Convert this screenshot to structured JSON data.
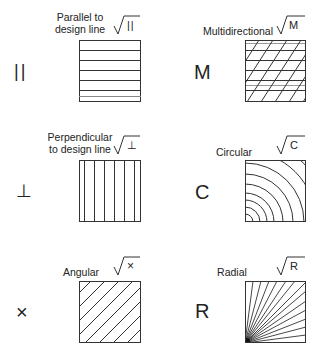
{
  "symbols": [
    {
      "id": "parallel",
      "label_line1": "Parallel to",
      "label_line2": "design line",
      "symbol": "||",
      "root_text": "||",
      "pattern": "horizontal-lines"
    },
    {
      "id": "multidirectional",
      "label_line1": "Multidirectional",
      "label_line2": "",
      "symbol": "M",
      "root_text": "M",
      "pattern": "cross-hatch"
    },
    {
      "id": "perpendicular",
      "label_line1": "Perpendicular",
      "label_line2": "to design line",
      "symbol": "⊥",
      "root_text": "⊥",
      "pattern": "vertical-lines"
    },
    {
      "id": "circular",
      "label_line1": "Circular",
      "label_line2": "",
      "symbol": "C",
      "root_text": "C",
      "pattern": "concentric-arcs"
    },
    {
      "id": "angular",
      "label_line1": "Angular",
      "label_line2": "",
      "symbol": "×",
      "root_text": "×",
      "pattern": "diagonal-lines"
    },
    {
      "id": "radial",
      "label_line1": "Radial",
      "label_line2": "",
      "symbol": "R",
      "root_text": "R",
      "pattern": "radial-lines"
    }
  ],
  "colors": {
    "line": "#333333",
    "text": "#222222",
    "background": "#ffffff"
  }
}
